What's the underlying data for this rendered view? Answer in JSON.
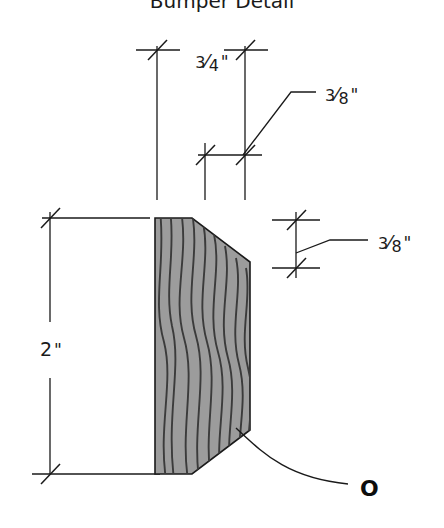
{
  "document": {
    "title": "Bumper Detail",
    "background_color": "#ffffff",
    "line_color": "#1a1a1a",
    "canvas": {
      "width": 444,
      "height": 528
    }
  },
  "title": {
    "label": "Bumper Detail",
    "clipped_top": true,
    "x": 222,
    "y": 8
  },
  "part": {
    "name": "bumper-profile",
    "description": "Wood bumper cross-section with chamfered right corners",
    "fill_color": "#9c9c9c",
    "grain_color": "#3b3b3b",
    "outline_color": "#1a1a1a",
    "polygon_points": "155,218 192,218 250,262 250,430 192,474 155,474",
    "bounds": {
      "left": 155,
      "top": 218,
      "right": 250,
      "bottom": 474
    }
  },
  "dimensions": [
    {
      "id": "width-overall",
      "label": "3/4\"",
      "numerator": "3",
      "denominator": "4",
      "unit": "\"",
      "orientation": "horizontal",
      "text_x": 212,
      "text_y": 68,
      "extension_line_left_x": 157,
      "extension_line_right_x": 245,
      "extension_top_y": 46,
      "extension_bottom_y": 200
    },
    {
      "id": "chamfer-top",
      "label": "3/8\"",
      "numerator": "3",
      "denominator": "8",
      "unit": "\"",
      "orientation": "horizontal-leader",
      "text_x": 325,
      "text_y": 101,
      "dim_line_y": 155,
      "dim_line_left_x": 198,
      "dim_line_right_x": 262,
      "leader_points": "243,155 291,92 316,92"
    },
    {
      "id": "chamfer-side",
      "label": "3/8\"",
      "numerator": "3",
      "denominator": "8",
      "unit": "\"",
      "orientation": "vertical-leader",
      "text_x": 380,
      "text_y": 245,
      "dim_line_x": 296,
      "dim_line_top_y": 220,
      "dim_line_bottom_y": 268,
      "leader_points": "296,253 330,240 368,240"
    },
    {
      "id": "height-overall",
      "label": "2\"",
      "value": "2",
      "unit": "\"",
      "orientation": "vertical",
      "text_x": 40,
      "text_y": 355,
      "dim_line_x": 50,
      "dim_line_top_y": 212,
      "dim_line_bottom_y": 474,
      "gap_top_y": 322,
      "gap_bottom_y": 378,
      "extension_top_right_x": 150,
      "extension_bottom_right_x": 160
    }
  ],
  "callouts": [
    {
      "id": "bumper-callout",
      "label": "O",
      "text_x": 362,
      "text_y": 496,
      "leader_start": {
        "x": 236,
        "y": 428
      },
      "leader_end": {
        "x": 348,
        "y": 484
      },
      "leader_path": "M236,428 C262,452 286,478 348,484"
    }
  ],
  "grain_lines": [
    "M160,218 C166,262 152,300 164,342 C174,382 158,426 166,474",
    "M180,218 C188,258 172,296 184,338 C196,380 180,428 188,474",
    "M200,222 C208,262 192,300 204,342 C216,384 200,430 208,474",
    "M220,240 C228,278 212,314 224,356 C236,396 220,440 228,470",
    "M238,256 C244,290 230,324 240,362 C250,400 236,438 242,462",
    "M170,218 C176,250 164,288 172,326 C182,368 166,414 174,474",
    "M190,218 C197,254 182,292 193,334 C205,376 189,424 196,474",
    "M210,230 C218,268 202,306 214,348 C226,390 210,436 218,474",
    "M229,248 C236,284 221,320 232,360 C243,398 228,440 235,466"
  ],
  "tick_marks": {
    "style": "architectural-slash",
    "count": 10
  }
}
